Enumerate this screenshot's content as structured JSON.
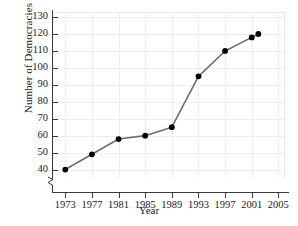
{
  "chart_data": {
    "type": "line",
    "title": "",
    "xlabel": "Year",
    "ylabel": "Number of Democracies",
    "xlim": [
      1971,
      2006
    ],
    "ylim": [
      35,
      133
    ],
    "grid": true,
    "legend": "none",
    "axis_break_y": true,
    "xticks": [
      1973,
      1977,
      1981,
      1985,
      1989,
      1993,
      1997,
      2001,
      2005
    ],
    "xtick_labels": [
      "1973",
      "1977",
      "1981",
      "1985",
      "1989",
      "1993",
      "1997",
      "2001",
      "2005"
    ],
    "yticks": [
      40,
      50,
      60,
      70,
      80,
      90,
      100,
      110,
      120,
      130
    ],
    "ytick_labels": [
      "40",
      "50",
      "60",
      "70",
      "80",
      "90",
      "100",
      "110",
      "120",
      "130"
    ],
    "series": [
      {
        "name": "Number of Democracies",
        "marker": "filled-circle",
        "line_color": "#6d6d6d",
        "marker_color": "#000000",
        "x": [
          1973,
          1977,
          1981,
          1985,
          1989,
          1993,
          1997,
          2001,
          2002
        ],
        "values": [
          40,
          49,
          58,
          60,
          65,
          95,
          110,
          118,
          120
        ]
      }
    ]
  },
  "colors": {
    "line": "#6d6d6d",
    "marker": "#000000",
    "grid": "#ededed",
    "axis": "#3a3a3a",
    "background": "#ffffff",
    "text": "#1a1a1a"
  }
}
